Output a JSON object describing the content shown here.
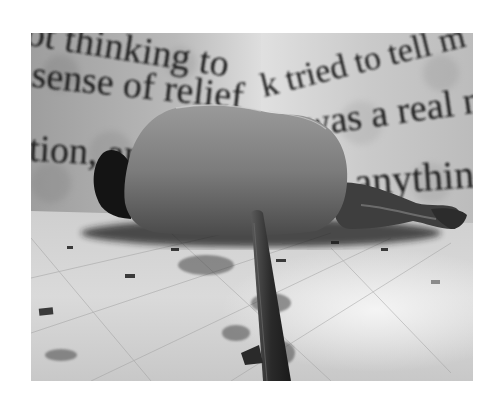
{
  "image": {
    "type": "photograph",
    "color_mode": "grayscale",
    "description": "A figure lies curled on a tiled floor between walls covered with large projected serif text; a rough wooden stake rises in the foreground.",
    "frame": {
      "left": 31,
      "top": 33,
      "width": 442,
      "height": 348,
      "border_color": "#ffffff"
    }
  },
  "wall_text": {
    "left_wall": [
      {
        "text": "ot thinking to"
      },
      {
        "text": "sense of relief"
      },
      {
        "text": "tion, an"
      }
    ],
    "right_wall": [
      {
        "text": "k tried to tell m"
      },
      {
        "text": "was a real n"
      },
      {
        "text": "r anythin"
      }
    ]
  },
  "colors": {
    "wall_light": "#d4d4d4",
    "wall_mid": "#a8a8a8",
    "floor_light": "#e6e6e6",
    "figure": "#7a7a7a",
    "shadow": "#151515",
    "text": "#1c1c1c"
  }
}
